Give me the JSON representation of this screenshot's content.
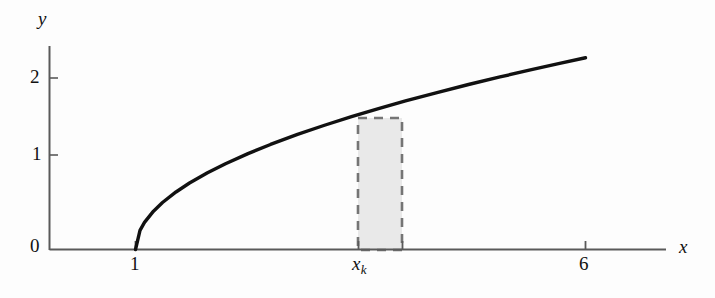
{
  "chart_data": {
    "type": "line",
    "title": "",
    "subtitle": "",
    "xlabel": "x",
    "ylabel": "y",
    "xlim": [
      0.0,
      7.3
    ],
    "ylim": [
      0.0,
      2.55
    ],
    "grid": false,
    "legend": null,
    "x_ticks": [
      {
        "value": 1,
        "label": "1"
      },
      {
        "value": 3.9,
        "label": "x",
        "sub": "k"
      },
      {
        "value": 4.35,
        "label": ""
      },
      {
        "value": 6,
        "label": "6"
      }
    ],
    "y_ticks": [
      {
        "value": 0,
        "label": "0"
      },
      {
        "value": 1,
        "label": "1"
      },
      {
        "value": 2,
        "label": "2"
      }
    ],
    "series": [
      {
        "name": "y = sqrt(x - 1)",
        "color": "#111111",
        "x": [
          1.0,
          1.05,
          1.1,
          1.2,
          1.3,
          1.45,
          1.6,
          1.8,
          2.0,
          2.25,
          2.5,
          2.8,
          3.1,
          3.4,
          3.7,
          4.0,
          4.35,
          4.7,
          5.05,
          5.4,
          5.7,
          6.0
        ],
        "values": [
          0.0,
          0.224,
          0.316,
          0.447,
          0.548,
          0.671,
          0.775,
          0.894,
          1.0,
          1.118,
          1.225,
          1.342,
          1.449,
          1.549,
          1.643,
          1.732,
          1.829,
          1.924,
          2.012,
          2.098,
          2.168,
          2.236
        ]
      }
    ],
    "annotations": [
      {
        "type": "shaded-rectangle",
        "name": "riemann-rectangle",
        "x_start": 3.9,
        "x_end": 4.35,
        "y_bottom": 0,
        "y_top": 1.7,
        "fill": "#e9e9e9",
        "stroke": "#757575",
        "stroke_style": "dashed"
      }
    ]
  },
  "labels": {
    "y_axis": "y",
    "x_axis": "x",
    "y_tick_0": "0",
    "y_tick_1": "1",
    "y_tick_2": "2",
    "x_tick_1": "1",
    "x_tick_xk_base": "x",
    "x_tick_xk_sub": "k",
    "x_tick_6": "6"
  },
  "colors": {
    "curve": "#111111",
    "axis": "#5a5a5a",
    "rect_fill": "#e9e9e9",
    "rect_stroke": "#757575",
    "text": "#111111",
    "background": "#fdfdfd"
  }
}
